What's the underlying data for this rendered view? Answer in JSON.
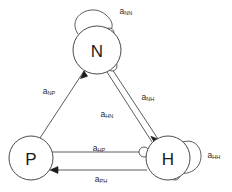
{
  "diagram": {
    "background_color": "#ffffff",
    "stroke_color": "#4a4a4a",
    "text_color": "#2b2b2b",
    "nodes": [
      {
        "id": "N",
        "label": "N",
        "cx": 97,
        "cy": 50,
        "r": 24
      },
      {
        "id": "P",
        "label": "P",
        "cx": 31,
        "cy": 158,
        "r": 22
      },
      {
        "id": "H",
        "label": "H",
        "cx": 168,
        "cy": 158,
        "r": 22
      }
    ],
    "edges": [
      {
        "id": "a_NN",
        "base": "a",
        "sub": "NN",
        "from": "N",
        "to": "N",
        "kind": "self-loop",
        "endpoint": "circle",
        "label_x": 126,
        "label_y": 11
      },
      {
        "id": "a_NP",
        "base": "a",
        "sub": "NP",
        "from": "P",
        "to": "N",
        "kind": "straight",
        "endpoint": "arrow",
        "label_x": 49,
        "label_y": 91
      },
      {
        "id": "a_NH",
        "base": "a",
        "sub": "NH",
        "from": "N",
        "to": "H",
        "kind": "straight",
        "endpoint": "arrow",
        "label_x": 148,
        "label_y": 97
      },
      {
        "id": "a_HN",
        "base": "a",
        "sub": "HN",
        "from": "H",
        "to": "N",
        "kind": "straight",
        "endpoint": "circle",
        "label_x": 107,
        "label_y": 114
      },
      {
        "id": "a_HP",
        "base": "a",
        "sub": "HP",
        "from": "P",
        "to": "H",
        "kind": "straight",
        "endpoint": "circle",
        "label_x": 99,
        "label_y": 148
      },
      {
        "id": "a_PH",
        "base": "a",
        "sub": "PH",
        "from": "H",
        "to": "P",
        "kind": "straight",
        "endpoint": "arrow",
        "label_x": 101,
        "label_y": 179
      },
      {
        "id": "a_HH",
        "base": "a",
        "sub": "HH",
        "from": "H",
        "to": "H",
        "kind": "self-loop",
        "endpoint": "circle",
        "label_x": 214,
        "label_y": 155
      }
    ]
  }
}
